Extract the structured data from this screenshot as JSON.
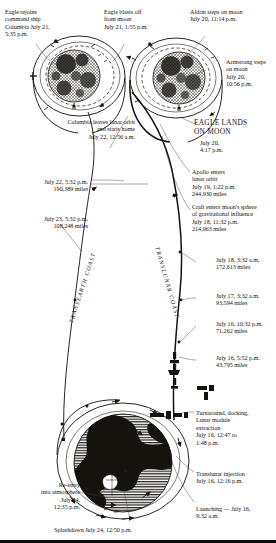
{
  "figure": {
    "type": "diagram",
    "bottom_rule_color": "#0d0b09"
  },
  "path_labels": {
    "transearth": "TRANSEARTH COAST",
    "translunar": "TRANSLUNAR COAST"
  },
  "annotations": {
    "eagle_rejoins": "Eagle rejoins\ncommand ship\nColumbia July 21,\n5:35 p.m.",
    "eagle_blasts_off": "Eagle blasts off\nfrom moon\nJuly 21, 1:55 p.m.",
    "aldrin_steps": "Aldrin steps on moon\nJuly 20, 11:14 p.m.",
    "armstrong_steps": "Armstrong steps\non moon\nJuly 20,\n10:56 p.m.",
    "columbia_leaves": "Columbia leaves lunar orbit\nand starts home\nJuly 22, 12:56 a.m.",
    "eagle_lands": "EAGLE LANDS\nON MOON",
    "eagle_lands_time": "July 20,\n4:17 p.m.",
    "apollo_enters_orbit": "Apollo enters\nlunar orbit\nJuly 19, 1:22 p.m.\n244,930 miles",
    "craft_enters_sphere": "Craft enters moon's sphere\nof gravitational influence\nJuly 18, 11:32 p.m.\n214,963 miles",
    "waypoint_jul22": "July 22, 5:32 p.m.\n190,389 miles",
    "waypoint_jul23": "July 23, 5:32 p.m.\n108,248 miles",
    "waypoint_jul18": "July 18, 3:32 a.m.\n172,613 miles",
    "waypoint_jul17": "July 17, 3:32 a.m.\n93,594 miles",
    "waypoint_jul16_1032": "July 16, 10:32 p.m.\n71,262 miles",
    "waypoint_jul16_552": "July 16, 5:52 p.m.\n43,795 miles",
    "turnaround": "Turnaround, docking,\nLunar module\nextraction\nJuly 16, 12:47 to\n1:48 p.m.",
    "translunar_injection": "Translunar injection\nJuly 16, 12:16 p.m.",
    "launching": "Launching — July 16,\n9:32 a.m.",
    "reentry": "Re-entry\ninto atmosphere\nJuly 24,\n12:35 p.m.",
    "splashdown": "Splashdown July 24, 12:50 p.m."
  },
  "timeline_events": [
    {
      "label": "Launching",
      "date": "July 16",
      "time": "9:32 a.m.",
      "distance": null
    },
    {
      "label": "Translunar injection",
      "date": "July 16",
      "time": "12:16 p.m.",
      "distance": null
    },
    {
      "label": "Turnaround, docking, Lunar module extraction",
      "date": "July 16",
      "time": "12:47 to 1:48 p.m.",
      "distance": null
    },
    {
      "label": "Translunar coast waypoint",
      "date": "July 16",
      "time": "5:52 p.m.",
      "distance": "43,795 miles"
    },
    {
      "label": "Translunar coast waypoint",
      "date": "July 16",
      "time": "10:32 p.m.",
      "distance": "71,262 miles"
    },
    {
      "label": "Translunar coast waypoint",
      "date": "July 17",
      "time": "3:32 a.m.",
      "distance": "93,594 miles"
    },
    {
      "label": "Translunar coast waypoint",
      "date": "July 18",
      "time": "3:32 a.m.",
      "distance": "172,613 miles"
    },
    {
      "label": "Craft enters moon's sphere of gravitational influence",
      "date": "July 18",
      "time": "11:32 p.m.",
      "distance": "214,963 miles"
    },
    {
      "label": "Apollo enters lunar orbit",
      "date": "July 19",
      "time": "1:22 p.m.",
      "distance": "244,930 miles"
    },
    {
      "label": "EAGLE LANDS ON MOON",
      "date": "July 20",
      "time": "4:17 p.m.",
      "distance": null
    },
    {
      "label": "Armstrong steps on moon",
      "date": "July 20",
      "time": "10:56 p.m.",
      "distance": null
    },
    {
      "label": "Aldrin steps on moon",
      "date": "July 20",
      "time": "11:14 p.m.",
      "distance": null
    },
    {
      "label": "Eagle blasts off from moon",
      "date": "July 21",
      "time": "1:55 p.m.",
      "distance": null
    },
    {
      "label": "Eagle rejoins command ship Columbia",
      "date": "July 21",
      "time": "5:35 p.m.",
      "distance": null
    },
    {
      "label": "Columbia leaves lunar orbit and starts home",
      "date": "July 22",
      "time": "12:56 a.m.",
      "distance": null
    },
    {
      "label": "Transearth coast waypoint",
      "date": "July 22",
      "time": "5:32 p.m.",
      "distance": "190,389 miles"
    },
    {
      "label": "Transearth coast waypoint",
      "date": "July 23",
      "time": "5:32 p.m.",
      "distance": "108,248 miles"
    },
    {
      "label": "Re-entry into atmosphere",
      "date": "July 24",
      "time": "12:35 p.m.",
      "distance": null
    },
    {
      "label": "Splashdown",
      "date": "July 24",
      "time": "12:50 p.m.",
      "distance": null
    }
  ]
}
